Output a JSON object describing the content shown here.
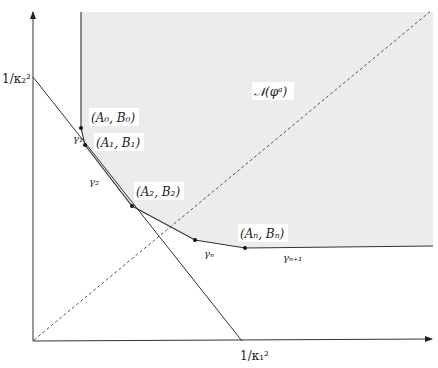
{
  "figure": {
    "colors": {
      "region_fill": "#ececec",
      "line": "#333333",
      "dashed": "#555555",
      "background": "#ffffff"
    },
    "axes": {
      "y_label": "1/κ₂²",
      "x_label": "1/κ₁²"
    },
    "region_label": "𝒩(φᵃ)",
    "points": [
      {
        "id": "A0B0",
        "label": "(A₀, B₀)"
      },
      {
        "id": "A1B1",
        "label": "(A₁, B₁)"
      },
      {
        "id": "A2B2",
        "label": "(A₂, B₂)"
      },
      {
        "id": "AnBn",
        "label": "(Aₙ, Bₙ)"
      }
    ],
    "segments": [
      {
        "id": "gamma1",
        "label": "γ₁"
      },
      {
        "id": "gamma2",
        "label": "γ₂"
      },
      {
        "id": "gamman",
        "label": "γₙ"
      },
      {
        "id": "gamman1",
        "label": "γₙ₊₁"
      }
    ]
  }
}
